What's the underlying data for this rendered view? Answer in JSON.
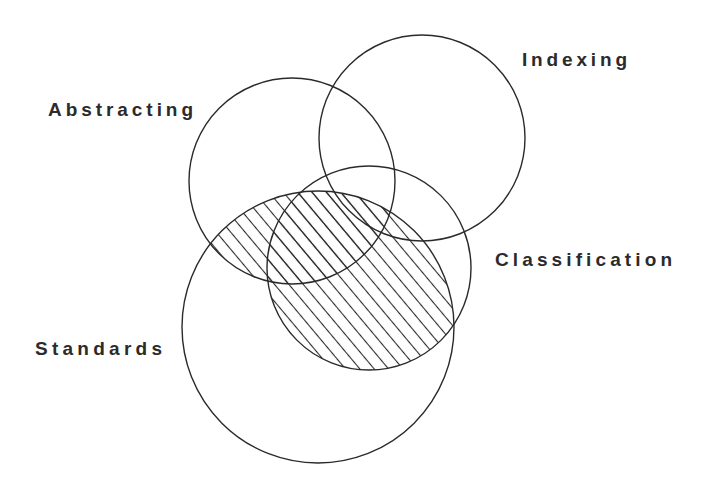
{
  "diagram": {
    "type": "venn",
    "title": "",
    "sets": [
      {
        "id": "abstracting",
        "label": "Abstracting",
        "cx": 292,
        "cy": 181,
        "r": 103
      },
      {
        "id": "indexing",
        "label": "Indexing",
        "cx": 422,
        "cy": 138,
        "r": 103
      },
      {
        "id": "classification",
        "label": "Classification",
        "cx": 369,
        "cy": 268,
        "r": 102
      },
      {
        "id": "standards",
        "label": "Standards",
        "cx": 318,
        "cy": 327,
        "r": 136
      }
    ],
    "labels": {
      "abstracting": {
        "text": "Abstracting",
        "x": 48,
        "y": 116,
        "width": 145
      },
      "indexing": {
        "text": "Indexing",
        "x": 522,
        "y": 66,
        "width": 105
      },
      "classification": {
        "text": "Classification",
        "x": 495,
        "y": 266,
        "width": 177
      },
      "standards": {
        "text": "Standards",
        "x": 35,
        "y": 355,
        "width": 127
      }
    },
    "hatched_region": "Standards ∩ (Abstracting ∪ Classification)",
    "colors": {
      "stroke": "#2a2a2a",
      "label": "#2b2b2b",
      "background": "#ffffff"
    }
  }
}
